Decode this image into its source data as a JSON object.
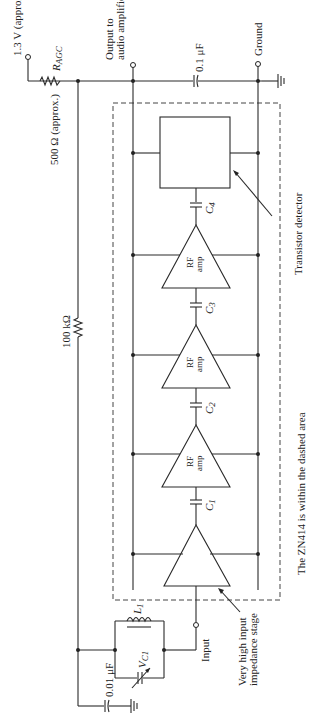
{
  "diagram": {
    "type": "circuit-schematic",
    "orientation": "rotated-90-ccw",
    "labels": {
      "supply": "1.3 V (approx.)",
      "ragc": "R",
      "ragc_sub": "AGC",
      "ragc_value": "500 Ω (approx.)",
      "output_line1": "Output to",
      "output_line2": "audio amplifier",
      "cap_out": "0.1 μF",
      "ground": "Ground",
      "feedback_res": "100 kΩ",
      "detector": "Transistor detector",
      "amp_label1": "RF",
      "amp_label2": "amp",
      "c1": "C",
      "c1_sub": "1",
      "c2": "C",
      "c2_sub": "2",
      "c3": "C",
      "c3_sub": "3",
      "c4": "C",
      "c4_sub": "4",
      "caption": "The ZN414 is within the dashed area",
      "input": "Input",
      "input_stage_line1": "Very high input",
      "input_stage_line2": "impedance stage",
      "inductor": "L",
      "inductor_sub": "1",
      "varcap": "V",
      "varcap_sub": "C1",
      "cap_in": "0.01 μF"
    }
  }
}
